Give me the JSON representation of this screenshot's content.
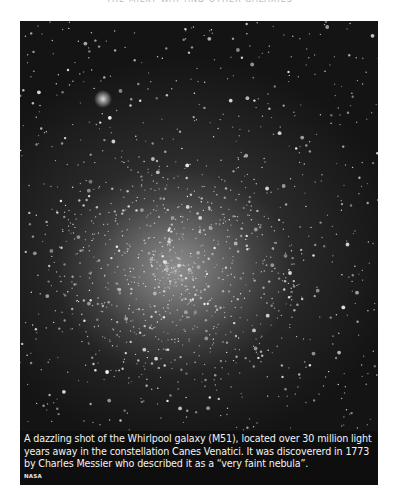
{
  "page": {
    "running_head": "THE MILKY WAY AND OTHER GALAXIES"
  },
  "figure": {
    "image_alt": "Dense star field with bright concentrated core",
    "caption": "A dazzling shot of the Whirlpool galaxy (M51), located over 30 million light years away in the constellation Canes Venatici. It was discovererd in 1773 by Charles Messier who described it as a “very faint nebula”.",
    "credit": "NASA"
  }
}
